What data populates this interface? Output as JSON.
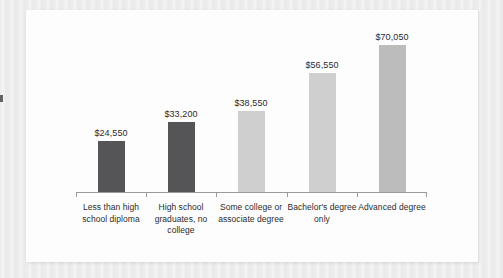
{
  "chart_data": {
    "type": "bar",
    "title": "",
    "subtitle": "",
    "xlabel": "",
    "ylabel": "",
    "categories": [
      "Less than high school diploma",
      "High school graduates, no college",
      "Some college or associate degree",
      "Bachelor's degree only",
      "Advanced degree"
    ],
    "values": [
      24550,
      33200,
      38550,
      56550,
      70050
    ],
    "value_labels": [
      "$24,550",
      "$33,200",
      "$38,550",
      "$56,550",
      "$70,050"
    ],
    "bar_colors": [
      "#555558",
      "#555558",
      "#cfcfcf",
      "#cfcfcf",
      "#bcbcbc"
    ],
    "ylim": [
      0,
      70050
    ],
    "grid": false,
    "legend": false,
    "axis_line_color": "#9a9a9a",
    "background_color": "#fdfdfd",
    "page_background_color": "#ececed"
  }
}
